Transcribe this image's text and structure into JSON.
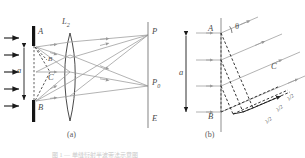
{
  "figure": {
    "panel_a": {
      "sublabel": "(a)",
      "labels": {
        "slit_top": "A",
        "slit_bottom": "B",
        "aperture": "a",
        "lens": "L",
        "lens_sub": "2",
        "point_c": "C",
        "point_b_small": "B",
        "screen_point_p": "P",
        "screen_point_p0": "P",
        "screen_point_p0_sub": "0",
        "screen": "E"
      },
      "incoming_ray_count": 5,
      "output_ray_count": 5
    },
    "panel_b": {
      "sublabel": "(b)",
      "labels": {
        "slit_top": "A",
        "slit_bottom": "B",
        "aperture": "a",
        "angle": "θ",
        "point_c": "C",
        "path_diff_1": "λ/2",
        "path_diff_2": "λ/2",
        "path_diff_3": "λ/2"
      },
      "incoming_ray_count": 4,
      "diffracted_ray_count": 4
    },
    "caption": "图 1 — 单缝衍射半波带法示意图",
    "colors": {
      "ray": "#9a9a9a",
      "line": "#8f8f8f",
      "dashed": "#4a4a4a",
      "barrier": "#141414",
      "label": "#4a4a4a",
      "background": "#ffffff"
    }
  }
}
